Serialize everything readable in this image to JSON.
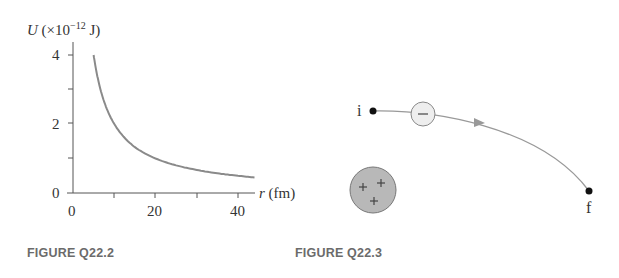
{
  "chart_data": {
    "type": "line",
    "title": "",
    "ylabel": "U (×10⁻¹² J)",
    "ylabel_parts": {
      "var": "U",
      "prefix": " (×10",
      "exp": "−12",
      "suffix": " J)"
    },
    "xlabel_parts": {
      "var": "r",
      "unit": " (fm)"
    },
    "xlabel": "r (fm)",
    "xlim": [
      0,
      44
    ],
    "ylim": [
      0,
      4
    ],
    "x_ticks": [
      0,
      10,
      20,
      30,
      40
    ],
    "x_tick_labels": [
      "0",
      "20",
      "40"
    ],
    "y_ticks": [
      0,
      1,
      2,
      3,
      4
    ],
    "y_tick_labels": [
      "0",
      "2",
      "4"
    ],
    "grid": false,
    "series": [
      {
        "name": "U(r)",
        "x": [
          5,
          6,
          8,
          10,
          12,
          15,
          20,
          25,
          30,
          35,
          40,
          44
        ],
        "values": [
          4.0,
          3.33,
          2.5,
          2.0,
          1.67,
          1.33,
          1.0,
          0.8,
          0.67,
          0.57,
          0.5,
          0.45
        ]
      }
    ],
    "color": "#8a8a8a"
  },
  "figure2": {
    "caption": "FIGURE Q22.2"
  },
  "figure3": {
    "caption": "FIGURE Q22.3",
    "start_label": "i",
    "end_label": "f",
    "moving_charge_sign": "−",
    "fixed_charge_signs": [
      "+",
      "+",
      "+"
    ]
  }
}
